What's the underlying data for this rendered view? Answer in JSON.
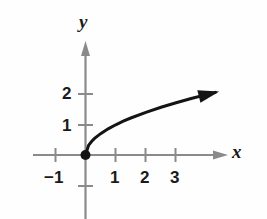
{
  "figure": {
    "kind": "cartesian-graph",
    "background_color": "#fefefe",
    "axis_color": "#8a8a8a",
    "curve_color": "#141414",
    "text_color": "#1a1a1a"
  },
  "labels": {
    "x_axis": "x",
    "y_axis": "y"
  },
  "ticks": {
    "x": [
      {
        "value": -1,
        "text": "−1"
      },
      {
        "value": 1,
        "text": "1"
      },
      {
        "value": 2,
        "text": "2"
      },
      {
        "value": 3,
        "text": "3"
      }
    ],
    "y": [
      {
        "value": 1,
        "text": "1"
      },
      {
        "value": 2,
        "text": "2"
      }
    ]
  },
  "chart_data": {
    "type": "line",
    "title": "",
    "xlabel": "x",
    "ylabel": "y",
    "xlim": [
      -1.75,
      4.75
    ],
    "ylim": [
      -2.1,
      3.85
    ],
    "grid": false,
    "legend": null,
    "xticks": [
      -1,
      1,
      2,
      3
    ],
    "yticks": [
      1,
      2
    ],
    "series": [
      {
        "name": "y = sqrt(x)",
        "equation": "y = √x",
        "style": "solid",
        "color": "#141414",
        "line_width": 3,
        "arrow_end": true,
        "endpoint_marker": "filled-circle",
        "endpoint": {
          "x": 0,
          "y": 0
        },
        "x": [
          0,
          0.1,
          0.2,
          0.3,
          0.5,
          0.75,
          1,
          1.25,
          1.5,
          2,
          2.5,
          3,
          3.5,
          4,
          4.3
        ],
        "y": [
          0,
          0.316,
          0.447,
          0.548,
          0.707,
          0.866,
          1,
          1.118,
          1.225,
          1.414,
          1.581,
          1.732,
          1.871,
          2.0,
          2.074
        ]
      }
    ],
    "annotations": [
      {
        "name": "origin-point",
        "x": 0,
        "y": 0,
        "marker": "filled-circle"
      },
      {
        "name": "curve-arrow",
        "x": 4.3,
        "y": 2.17
      }
    ]
  }
}
